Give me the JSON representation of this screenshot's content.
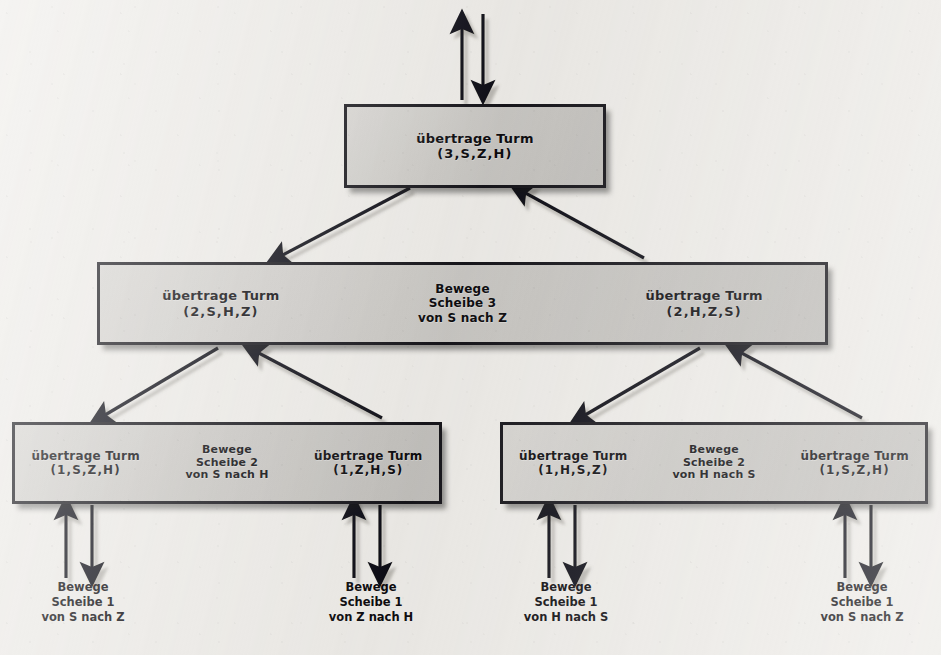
{
  "diagram": {
    "background_color": "#eceae6",
    "node_fill_color": "#c9c7c3",
    "node_border_color": "#16151a",
    "arrow_color": "#101014",
    "levels": [
      {
        "id": "level-0",
        "nodes": [
          {
            "id": "root",
            "cells": [
              {
                "kind": "call",
                "lines": [
                  "übertrage Turm",
                  "(3,S,Z,H)"
                ]
              }
            ]
          }
        ]
      },
      {
        "id": "level-1",
        "nodes": [
          {
            "id": "level1-node",
            "cells": [
              {
                "kind": "call",
                "lines": [
                  "übertrage Turm",
                  "(2,S,H,Z)"
                ]
              },
              {
                "kind": "move",
                "lines": [
                  "Bewege",
                  "Scheibe 3",
                  "von S nach Z"
                ]
              },
              {
                "kind": "call",
                "lines": [
                  "übertrage Turm",
                  "(2,H,Z,S)"
                ]
              }
            ]
          }
        ]
      },
      {
        "id": "level-2",
        "nodes": [
          {
            "id": "level2-left",
            "cells": [
              {
                "kind": "call",
                "lines": [
                  "übertrage Turm",
                  "(1,S,Z,H)"
                ]
              },
              {
                "kind": "move",
                "lines": [
                  "Bewege",
                  "Scheibe 2",
                  "von S nach H"
                ]
              },
              {
                "kind": "call",
                "lines": [
                  "übertrage Turm",
                  "(1,Z,H,S)"
                ]
              }
            ]
          },
          {
            "id": "level2-right",
            "cells": [
              {
                "kind": "call",
                "lines": [
                  "übertrage Turm",
                  "(1,H,S,Z)"
                ]
              },
              {
                "kind": "move",
                "lines": [
                  "Bewege",
                  "Scheibe 2",
                  "von H nach S"
                ]
              },
              {
                "kind": "call",
                "lines": [
                  "übertrage Turm",
                  "(1,S,Z,H)"
                ]
              }
            ]
          }
        ]
      }
    ],
    "leaves": [
      {
        "id": "leaf-1",
        "lines": [
          "Bewege",
          "Scheibe 1",
          "von S nach Z"
        ]
      },
      {
        "id": "leaf-2",
        "lines": [
          "Bewege",
          "Scheibe 1",
          "von Z nach H"
        ]
      },
      {
        "id": "leaf-3",
        "lines": [
          "Bewege",
          "Scheibe 1",
          "von H nach S"
        ]
      },
      {
        "id": "leaf-4",
        "lines": [
          "Bewege",
          "Scheibe 1",
          "von S nach Z"
        ]
      }
    ],
    "arrow_pairs": [
      {
        "id": "top-entry-exit",
        "down_label": "Aufruf",
        "up_label": "Rückkehr"
      },
      {
        "id": "leaf-1-arrows",
        "down_label": "Aufruf",
        "up_label": "Rückkehr"
      },
      {
        "id": "leaf-2-arrows",
        "down_label": "Aufruf",
        "up_label": "Rückkehr"
      },
      {
        "id": "leaf-3-arrows",
        "down_label": "Aufruf",
        "up_label": "Rückkehr"
      },
      {
        "id": "leaf-4-arrows",
        "down_label": "Aufruf",
        "up_label": "Rückkehr"
      }
    ]
  }
}
